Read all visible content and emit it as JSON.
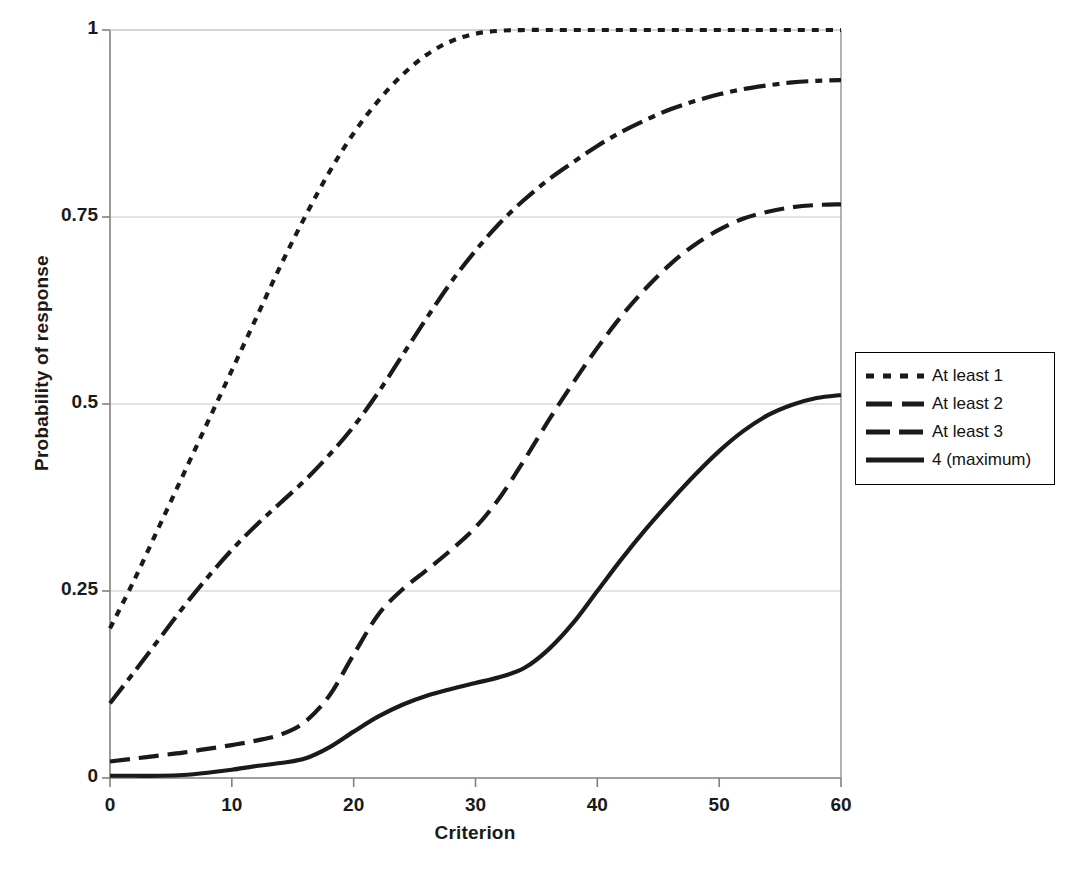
{
  "chart_data": {
    "type": "line",
    "title": "",
    "xlabel": "Criterion",
    "ylabel": "Probability of response",
    "xlim": [
      0,
      60
    ],
    "ylim": [
      0,
      1
    ],
    "xticks": [
      "0",
      "10",
      "20",
      "30",
      "40",
      "50",
      "60"
    ],
    "yticks": [
      "0",
      "0.25",
      "0.5",
      "0.75",
      "1"
    ],
    "grid": "horizontal",
    "legend_position": "right",
    "x": [
      0,
      2,
      4,
      6,
      8,
      10,
      12,
      14,
      16,
      18,
      20,
      22,
      24,
      26,
      28,
      30,
      32,
      34,
      36,
      38,
      40,
      42,
      44,
      46,
      48,
      50,
      52,
      54,
      56,
      58,
      60
    ],
    "series": [
      {
        "name": "At least 1",
        "style": "dotted",
        "values": [
          0.2,
          0.265,
          0.335,
          0.405,
          0.475,
          0.545,
          0.615,
          0.685,
          0.75,
          0.81,
          0.862,
          0.905,
          0.94,
          0.967,
          0.985,
          0.995,
          0.999,
          1.0,
          1.0,
          1.0,
          1.0,
          1.0,
          1.0,
          1.0,
          1.0,
          1.0,
          1.0,
          1.0,
          1.0,
          1.0,
          1.0
        ]
      },
      {
        "name": "At least 2",
        "style": "dashdot",
        "values": [
          0.1,
          0.142,
          0.185,
          0.228,
          0.268,
          0.305,
          0.338,
          0.368,
          0.398,
          0.432,
          0.47,
          0.515,
          0.565,
          0.615,
          0.663,
          0.705,
          0.742,
          0.773,
          0.8,
          0.823,
          0.845,
          0.864,
          0.88,
          0.894,
          0.905,
          0.914,
          0.921,
          0.926,
          0.93,
          0.932,
          0.933
        ]
      },
      {
        "name": "At least 3",
        "style": "dashed",
        "values": [
          0.022,
          0.026,
          0.03,
          0.034,
          0.039,
          0.044,
          0.05,
          0.058,
          0.075,
          0.11,
          0.165,
          0.218,
          0.252,
          0.278,
          0.305,
          0.335,
          0.375,
          0.425,
          0.478,
          0.528,
          0.575,
          0.618,
          0.655,
          0.687,
          0.713,
          0.733,
          0.748,
          0.757,
          0.763,
          0.766,
          0.767
        ]
      },
      {
        "name": "4 (maximum)",
        "style": "solid",
        "values": [
          0.003,
          0.003,
          0.003,
          0.004,
          0.007,
          0.011,
          0.016,
          0.02,
          0.026,
          0.041,
          0.062,
          0.082,
          0.098,
          0.11,
          0.119,
          0.127,
          0.135,
          0.147,
          0.172,
          0.207,
          0.25,
          0.293,
          0.333,
          0.37,
          0.405,
          0.437,
          0.464,
          0.485,
          0.499,
          0.508,
          0.512
        ]
      }
    ]
  },
  "legend": {
    "items": [
      {
        "label": "At least 1",
        "style": "dotted"
      },
      {
        "label": "At least 2",
        "style": "dashdot"
      },
      {
        "label": "At least 3",
        "style": "dashed"
      },
      {
        "label": "4 (maximum)",
        "style": "solid"
      }
    ]
  },
  "colors": {
    "line": "#1a1a1a",
    "axis": "#808080",
    "grid": "#c8c8c8",
    "text": "#1a1a1a",
    "background": "#ffffff"
  }
}
